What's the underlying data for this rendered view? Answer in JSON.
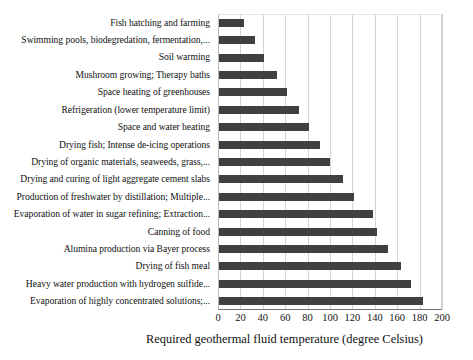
{
  "chart_data": {
    "type": "bar",
    "orientation": "horizontal",
    "title": "",
    "xlabel": "Required geothermal fluid temperature (degree Celsius)",
    "ylabel": "",
    "xlim": [
      0,
      200
    ],
    "xticks": [
      0,
      20,
      40,
      60,
      80,
      100,
      120,
      140,
      160,
      180,
      200
    ],
    "grid": true,
    "legend": false,
    "bar_color": "#404040",
    "categories": [
      "Fish hatching and farming",
      "Swimming pools, biodegredation, fermentation,...",
      "Soil warming",
      "Mushroom growing; Therapy baths",
      "Space heating of greenhouses",
      "Refrigeration (lower temperature limit)",
      "Space and water heating",
      "Drying fish; Intense de-icing operations",
      "Drying of organic materials, seaweeds, grass,...",
      "Drying and curing of light aggregate cement slabs",
      "Production of freshwater by distillation; Multiple...",
      "Evaporation of water in sugar refining; Extraction...",
      "Canning of food",
      "Alumina production via Bayer process",
      "Drying of fish meal",
      "Heavy water production with hydrogen sulfide...",
      "Evaporation of highly concentrated solutions;..."
    ],
    "values": [
      23,
      33,
      41,
      53,
      62,
      72,
      81,
      91,
      100,
      112,
      121,
      138,
      142,
      152,
      163,
      172,
      183
    ]
  }
}
